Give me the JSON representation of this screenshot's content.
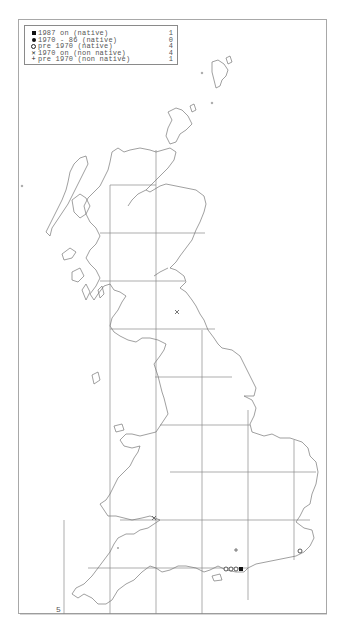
{
  "map": {
    "type": "distribution-map",
    "region": "Great Britain",
    "frame": {
      "x": 18,
      "y": 19,
      "width": 309,
      "height": 595
    },
    "grid_spacing_px": 46,
    "corner_label": "5"
  },
  "legend": {
    "items": [
      {
        "symbol": "filled-square",
        "label": "1987 on (native)",
        "count": "1"
      },
      {
        "symbol": "filled-circle",
        "label": "1970 - 86 (native)",
        "count": "0"
      },
      {
        "symbol": "open-circle",
        "label": "pre 1970 (native)",
        "count": "4"
      },
      {
        "symbol": "cross-x",
        "label": "1970 on (non native)",
        "count": "4"
      },
      {
        "symbol": "plus",
        "label": "pre 1970 (non native)",
        "count": "1"
      }
    ]
  },
  "records": [
    {
      "symbol": "cross-x",
      "x": 177,
      "y": 312
    },
    {
      "symbol": "cross-x",
      "x": 154,
      "y": 518
    },
    {
      "symbol": "plus",
      "x": 236,
      "y": 550
    },
    {
      "symbol": "open-circle",
      "x": 300,
      "y": 551
    },
    {
      "symbol": "open-circle",
      "x": 226,
      "y": 569
    },
    {
      "symbol": "open-circle",
      "x": 231,
      "y": 569
    },
    {
      "symbol": "open-circle",
      "x": 236,
      "y": 569
    },
    {
      "symbol": "filled-square",
      "x": 241,
      "y": 569
    }
  ]
}
